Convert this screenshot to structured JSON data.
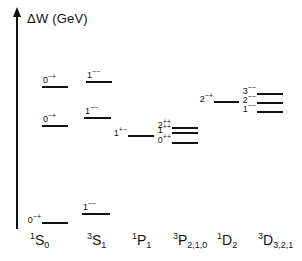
{
  "axis": {
    "label": "ΔW (GeV)"
  },
  "columns": [
    {
      "id": "1S0",
      "sup": "1",
      "letter": "S",
      "sub": "0"
    },
    {
      "id": "3S1",
      "sup": "3",
      "letter": "S",
      "sub": "1"
    },
    {
      "id": "1P1",
      "sup": "1",
      "letter": "P",
      "sub": "1"
    },
    {
      "id": "3P210",
      "sup": "3",
      "letter": "P",
      "sub": "2,1,0"
    },
    {
      "id": "1D2",
      "sup": "1",
      "letter": "D",
      "sub": "2"
    },
    {
      "id": "3D321",
      "sup": "3",
      "letter": "D",
      "sub": "3,2,1"
    }
  ],
  "levels": [
    {
      "column": "1S0",
      "j": "0",
      "pc": "−+",
      "x": 42,
      "y": 86,
      "w": 26,
      "label_pos": "above"
    },
    {
      "column": "1S0",
      "j": "0",
      "pc": "−+",
      "x": 42,
      "y": 125,
      "w": 26,
      "label_pos": "above"
    },
    {
      "column": "1S0",
      "j": "0",
      "pc": "−+",
      "x": 42,
      "y": 222,
      "w": 26,
      "label_pos": "left"
    },
    {
      "column": "3S1",
      "j": "1",
      "pc": "−−",
      "x": 86,
      "y": 81,
      "w": 26,
      "label_pos": "above"
    },
    {
      "column": "3S1",
      "j": "1",
      "pc": "−−",
      "x": 84,
      "y": 117,
      "w": 27,
      "label_pos": "above"
    },
    {
      "column": "3S1",
      "j": "1",
      "pc": "−−",
      "x": 82,
      "y": 213,
      "w": 28,
      "label_pos": "above"
    },
    {
      "column": "1P1",
      "j": "1",
      "pc": "+−",
      "x": 128,
      "y": 135,
      "w": 26,
      "label_pos": "left"
    },
    {
      "column": "3P210",
      "j": "2",
      "pc": "++",
      "x": 172,
      "y": 127,
      "w": 26,
      "label_pos": "left"
    },
    {
      "column": "3P210",
      "j": "1",
      "pc": "++",
      "x": 172,
      "y": 132,
      "w": 26,
      "label_pos": "left"
    },
    {
      "column": "3P210",
      "j": "0",
      "pc": "++",
      "x": 172,
      "y": 142,
      "w": 26,
      "label_pos": "left"
    },
    {
      "column": "1D2",
      "j": "2",
      "pc": "−+",
      "x": 214,
      "y": 101,
      "w": 25,
      "label_pos": "left"
    },
    {
      "column": "3D321",
      "j": "3",
      "pc": "−−",
      "x": 257,
      "y": 93,
      "w": 26,
      "label_pos": "left"
    },
    {
      "column": "3D321",
      "j": "2",
      "pc": "−−",
      "x": 257,
      "y": 102,
      "w": 26,
      "label_pos": "left"
    },
    {
      "column": "3D321",
      "j": "1",
      "pc": "−−",
      "x": 257,
      "y": 111,
      "w": 26,
      "label_pos": "left"
    }
  ],
  "colors": {
    "ink": "#111111",
    "background": "#ffffff"
  }
}
